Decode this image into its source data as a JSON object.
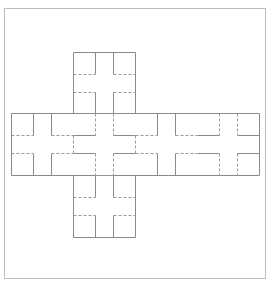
{
  "diagram": {
    "type": "cube-net",
    "colors": {
      "frame": "#bdbdbd",
      "solid_line": "#8a8a8a",
      "dashed_line": "#9a9a9a",
      "background": "#ffffff"
    },
    "frame": {
      "x": 4,
      "y": 8,
      "w": 261,
      "h": 270
    },
    "faces": [
      {
        "id": "top-1",
        "x": 73,
        "y": 52,
        "size": 62
      },
      {
        "id": "top-2",
        "x": 73,
        "y": 113,
        "size": 62
      },
      {
        "id": "left",
        "x": 11,
        "y": 113,
        "size": 62
      },
      {
        "id": "center",
        "x": 73,
        "y": 113,
        "size": 62
      },
      {
        "id": "right-1",
        "x": 135,
        "y": 113,
        "size": 62
      },
      {
        "id": "right-2",
        "x": 197,
        "y": 113,
        "size": 62
      },
      {
        "id": "bottom",
        "x": 73,
        "y": 175,
        "size": 62
      }
    ],
    "outline": [
      [
        73,
        52,
        135,
        52
      ],
      [
        73,
        52,
        73,
        113
      ],
      [
        135,
        52,
        135,
        113
      ],
      [
        11,
        113,
        259,
        113
      ],
      [
        11,
        175,
        259,
        175
      ],
      [
        11,
        113,
        11,
        175
      ],
      [
        259,
        113,
        259,
        175
      ],
      [
        73,
        175,
        73,
        237
      ],
      [
        135,
        175,
        135,
        237
      ],
      [
        73,
        237,
        135,
        237
      ]
    ],
    "solid_segments": [
      [
        95,
        52,
        95,
        74
      ],
      [
        113,
        52,
        113,
        74
      ],
      [
        95,
        92,
        95,
        113
      ],
      [
        113,
        92,
        113,
        113
      ],
      [
        33,
        113,
        33,
        135
      ],
      [
        51,
        113,
        51,
        135
      ],
      [
        33,
        153,
        33,
        175
      ],
      [
        51,
        153,
        51,
        175
      ],
      [
        73,
        135,
        95,
        135
      ],
      [
        113,
        135,
        135,
        135
      ],
      [
        73,
        153,
        95,
        153
      ],
      [
        113,
        153,
        135,
        153
      ],
      [
        157,
        113,
        157,
        135
      ],
      [
        175,
        113,
        175,
        135
      ],
      [
        157,
        153,
        157,
        175
      ],
      [
        175,
        153,
        175,
        175
      ],
      [
        197,
        135,
        219,
        135
      ],
      [
        237,
        135,
        259,
        135
      ],
      [
        197,
        153,
        219,
        153
      ],
      [
        237,
        153,
        259,
        153
      ],
      [
        95,
        175,
        95,
        197
      ],
      [
        113,
        175,
        113,
        197
      ],
      [
        95,
        215,
        95,
        237
      ],
      [
        113,
        215,
        113,
        237
      ]
    ],
    "dashed_segments": [
      [
        73,
        74,
        95,
        74
      ],
      [
        113,
        74,
        135,
        74
      ],
      [
        73,
        92,
        95,
        92
      ],
      [
        113,
        92,
        135,
        92
      ],
      [
        11,
        135,
        33,
        135
      ],
      [
        51,
        135,
        73,
        135
      ],
      [
        11,
        153,
        33,
        153
      ],
      [
        51,
        153,
        73,
        153
      ],
      [
        73,
        135,
        73,
        153
      ],
      [
        135,
        135,
        135,
        153
      ],
      [
        95,
        113,
        95,
        135
      ],
      [
        113,
        113,
        113,
        135
      ],
      [
        95,
        153,
        95,
        175
      ],
      [
        113,
        153,
        113,
        175
      ],
      [
        95,
        175,
        113,
        175
      ],
      [
        135,
        135,
        157,
        135
      ],
      [
        175,
        135,
        197,
        135
      ],
      [
        135,
        153,
        157,
        153
      ],
      [
        175,
        153,
        197,
        153
      ],
      [
        219,
        113,
        219,
        135
      ],
      [
        237,
        113,
        237,
        135
      ],
      [
        219,
        153,
        219,
        175
      ],
      [
        237,
        153,
        237,
        175
      ],
      [
        73,
        197,
        95,
        197
      ],
      [
        113,
        197,
        135,
        197
      ],
      [
        73,
        215,
        95,
        215
      ],
      [
        113,
        215,
        135,
        215
      ]
    ]
  }
}
